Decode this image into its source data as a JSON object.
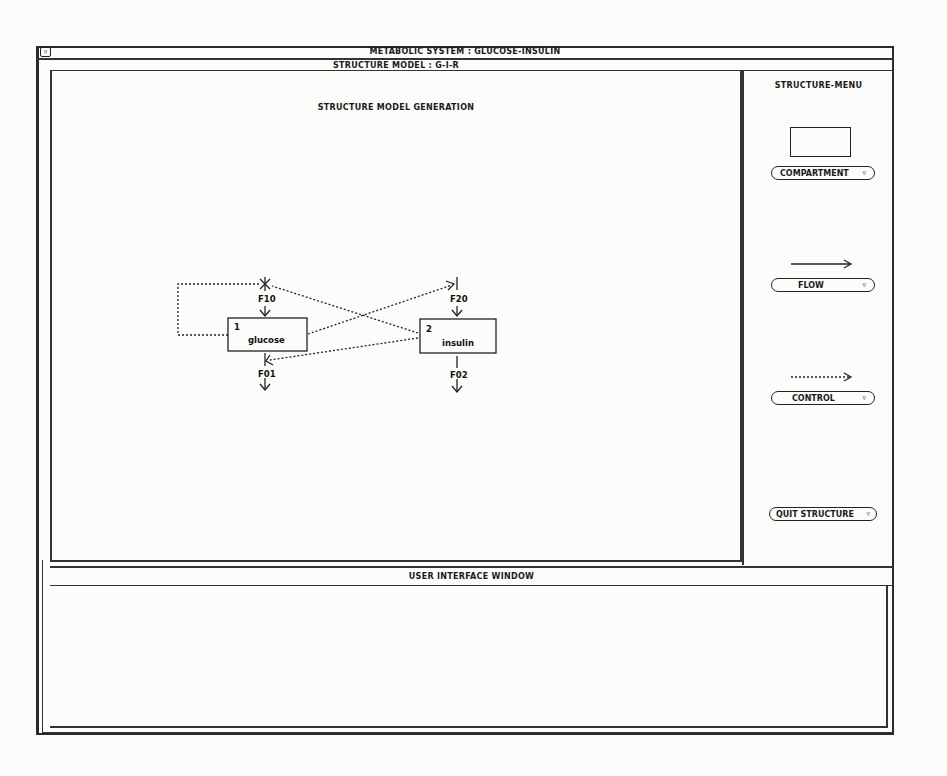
{
  "window": {
    "title": "METABOLIC SYSTEM : GLUCOSE-INSULIN",
    "close_icon": "triangle-down-icon"
  },
  "structure_model": {
    "header": "STRUCTURE MODEL : G-I-R",
    "canvas_title": "STRUCTURE MODEL GENERATION",
    "compartments": [
      {
        "number": "1",
        "name": "glucose"
      },
      {
        "number": "2",
        "name": "insulin"
      }
    ],
    "flows": [
      {
        "label": "F10",
        "from": "environment",
        "to": "glucose"
      },
      {
        "label": "F01",
        "from": "glucose",
        "to": "environment"
      },
      {
        "label": "F20",
        "from": "environment",
        "to": "insulin"
      },
      {
        "label": "F02",
        "from": "insulin",
        "to": "environment"
      }
    ],
    "controls": [
      {
        "from": "glucose",
        "to": "F10"
      },
      {
        "from": "glucose",
        "to": "F20"
      },
      {
        "from": "insulin",
        "to": "F10"
      },
      {
        "from": "insulin",
        "to": "F01"
      }
    ]
  },
  "menu": {
    "title": "STRUCTURE-MENU",
    "items": [
      {
        "label": "COMPARTMENT",
        "icon": "rectangle-icon"
      },
      {
        "label": "FLOW",
        "icon": "solid-arrow-icon"
      },
      {
        "label": "CONTROL",
        "icon": "dotted-arrow-icon"
      },
      {
        "label": "QUIT STRUCTURE",
        "icon": ""
      }
    ],
    "dropdown_glyph": "▿"
  },
  "user_interface": {
    "header": "USER INTERFACE WINDOW",
    "content": ""
  }
}
